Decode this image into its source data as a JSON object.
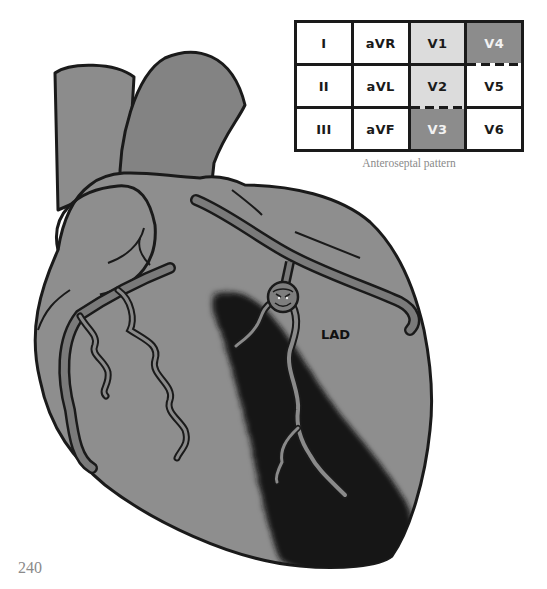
{
  "figure": {
    "lead_table": {
      "rows": [
        [
          {
            "label": "I",
            "shade": "none"
          },
          {
            "label": "aVR",
            "shade": "none"
          },
          {
            "label": "V1",
            "shade": "light"
          },
          {
            "label": "V4",
            "shade": "dark"
          }
        ],
        [
          {
            "label": "II",
            "shade": "none"
          },
          {
            "label": "aVL",
            "shade": "none"
          },
          {
            "label": "V2",
            "shade": "light"
          },
          {
            "label": "V5",
            "shade": "none"
          }
        ],
        [
          {
            "label": "III",
            "shade": "none"
          },
          {
            "label": "aVF",
            "shade": "none"
          },
          {
            "label": "V3",
            "shade": "dark"
          },
          {
            "label": "V6",
            "shade": "none"
          }
        ]
      ]
    },
    "caption": "Anteroseptal pattern",
    "heart_labels": {
      "artery": "LAD"
    },
    "colors": {
      "heart_fill": "#8e8e8e",
      "vessel_fill": "#7a7a7a",
      "infarct": "#141414",
      "outline": "#1a1a1a",
      "light_cell": "#dcdcdc",
      "dark_cell": "#8c8c8c"
    }
  },
  "page": {
    "number": "240"
  }
}
